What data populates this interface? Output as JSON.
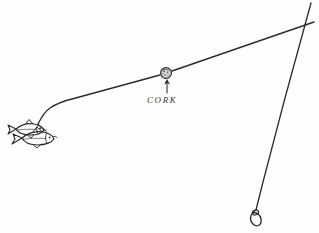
{
  "figure": {
    "kind": "hand-drawn-sketch",
    "background_color": "#fefefe",
    "ink_color": "#2b2b2b",
    "width": 319,
    "height": 233
  },
  "labels": {
    "cork": "CORK"
  },
  "annotations": {
    "cork_pointer": {
      "icon": "up-arrow-icon",
      "points_to": "cork-float",
      "from_x": 167,
      "from_y": 94,
      "to_x": 167,
      "to_y": 80
    }
  },
  "parts": {
    "cork_float": {
      "name": "cork",
      "center_x": 166,
      "center_y": 73,
      "radius": 5.4,
      "fill_color": "#d8d6d2",
      "outline_color": "#2b2b2b"
    },
    "main_line": {
      "name": "fishing-line",
      "description": "long line running from baitfish up to the right toward the rod tip",
      "start_x": 40,
      "start_y": 123,
      "end_x": 314,
      "end_y": 22
    },
    "rod": {
      "name": "rod-or-leader-line",
      "description": "steep line from upper right down to the swivel loop",
      "start_x": 311,
      "start_y": 3,
      "end_x": 254,
      "end_y": 214
    },
    "swivel_loop": {
      "name": "swivel-loop",
      "center_x": 254,
      "center_y": 218,
      "radius": 4
    },
    "baitfish": {
      "name": "baitfish-pair",
      "count": 2,
      "center_x": 28,
      "center_y": 133
    }
  }
}
